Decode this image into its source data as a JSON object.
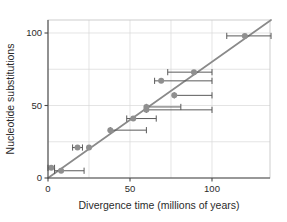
{
  "chart_data": {
    "type": "scatter",
    "title": "",
    "xlabel": "Divergence time (millions of years)",
    "ylabel": "Nucleotide substitutions",
    "xlim": [
      -5,
      140
    ],
    "ylim": [
      -4,
      112
    ],
    "xticks": [
      0,
      50,
      100
    ],
    "xtick_labels": [
      "0",
      "50",
      "100"
    ],
    "yticks": [
      0,
      50,
      100
    ],
    "ytick_labels": [
      "0",
      "50",
      "100"
    ],
    "grid": true,
    "legend": "none",
    "point_color": "#8f8f8f",
    "line_color": "#8a8a8a",
    "errorbar_color": "#5a5a5a",
    "grid_color": "#d9d9d9",
    "axis_color": "#4a4a4a",
    "error_direction": "horizontal",
    "fit_line": {
      "type": "line",
      "slope": 0.8,
      "intercept": 0.0,
      "x_start": 0,
      "y_start": 0,
      "x_end": 136,
      "y_end": 109
    },
    "points": [
      {
        "x": 2,
        "y": 7,
        "xerr_low": 2,
        "xerr_high": 2
      },
      {
        "x": 8,
        "y": 5,
        "xerr_low": 4,
        "xerr_high": 14
      },
      {
        "x": 18,
        "y": 21,
        "xerr_low": 3,
        "xerr_high": 3
      },
      {
        "x": 25,
        "y": 21,
        "xerr_low": 0,
        "xerr_high": 0
      },
      {
        "x": 38,
        "y": 33,
        "xerr_low": 0,
        "xerr_high": 22
      },
      {
        "x": 52,
        "y": 41,
        "xerr_low": 4,
        "xerr_high": 14
      },
      {
        "x": 60,
        "y": 47,
        "xerr_low": 0,
        "xerr_high": 40
      },
      {
        "x": 60,
        "y": 49,
        "xerr_low": 0,
        "xerr_high": 21
      },
      {
        "x": 69,
        "y": 67,
        "xerr_low": 4,
        "xerr_high": 31
      },
      {
        "x": 77,
        "y": 57,
        "xerr_low": 0,
        "xerr_high": 23
      },
      {
        "x": 89,
        "y": 73,
        "xerr_low": 16,
        "xerr_high": 11
      },
      {
        "x": 120,
        "y": 98,
        "xerr_low": 11,
        "xerr_high": 16
      }
    ]
  }
}
